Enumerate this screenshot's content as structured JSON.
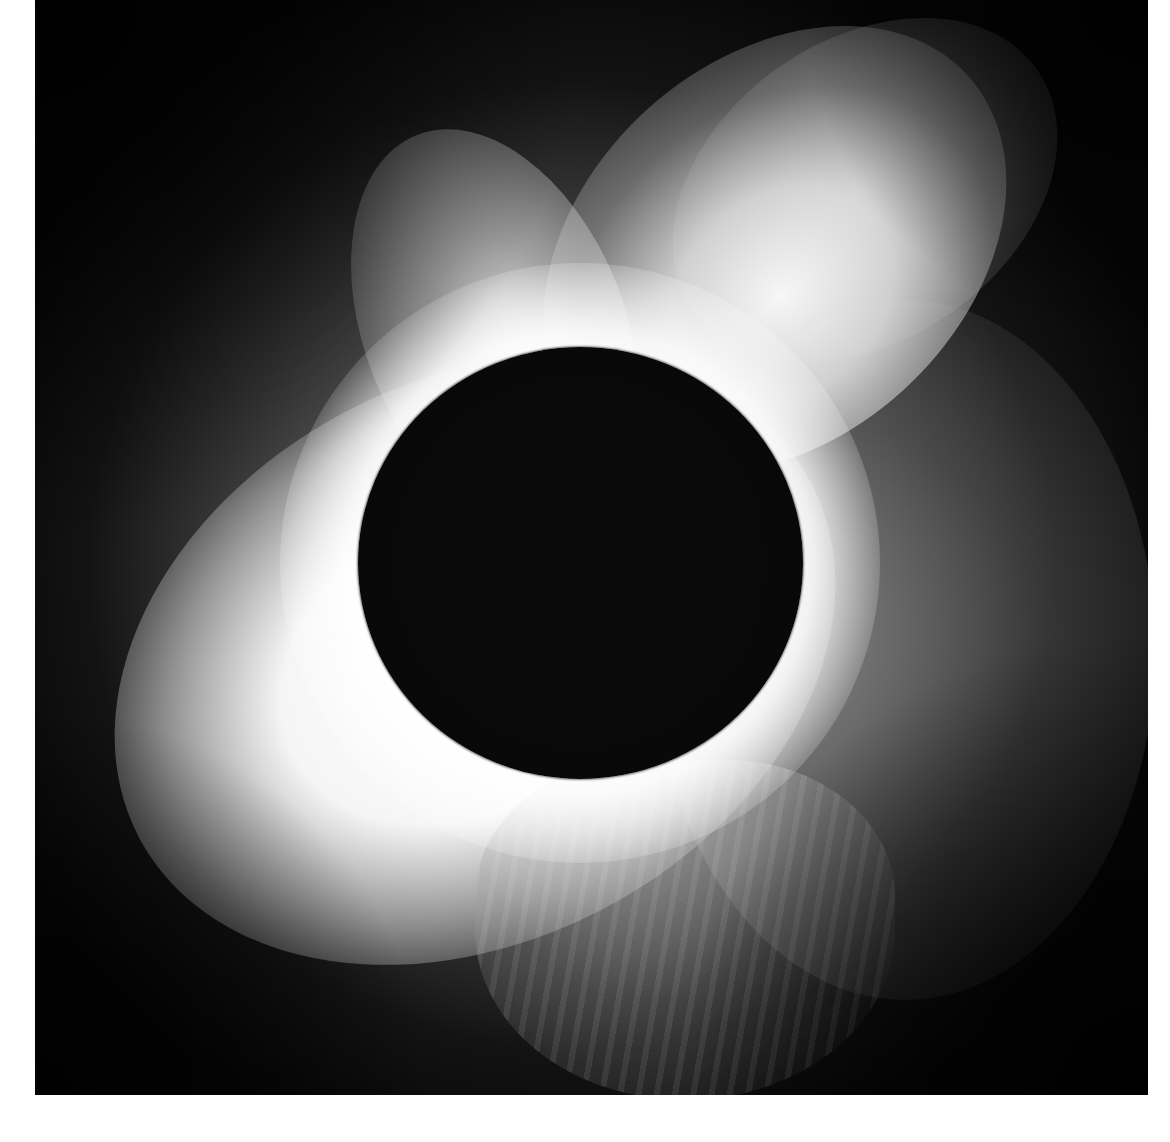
{
  "image": {
    "subject": "total solar eclipse",
    "description": "Black lunar disk surrounded by bright white solar corona with streamers on a dark sky background",
    "colors": {
      "sky": "#050505",
      "corona_core": "#ffffff",
      "corona_outer": "#808080",
      "disk": "#0a0a0a",
      "page_margin": "#ffffff"
    }
  }
}
